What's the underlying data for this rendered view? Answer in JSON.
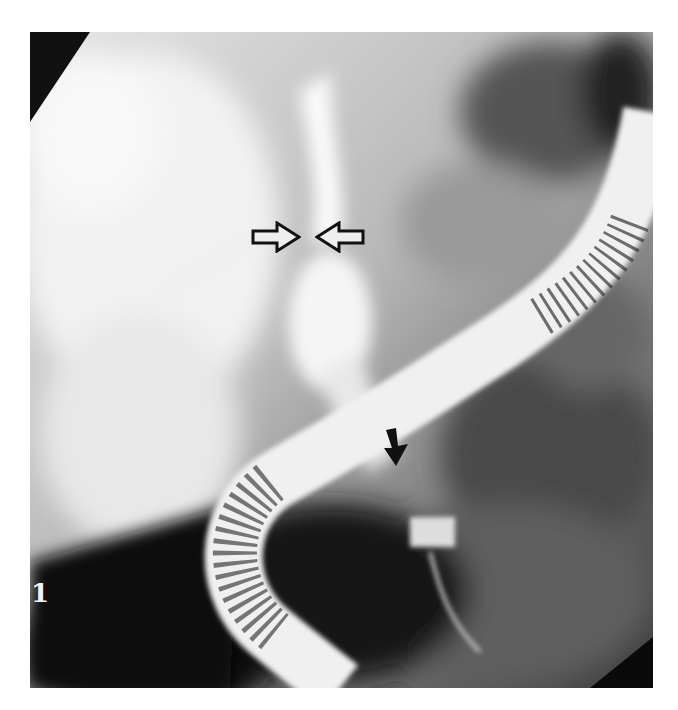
{
  "figure": {
    "panel_label": "1",
    "annotations": [
      {
        "type": "open-arrow-right",
        "label": "stricture-marker-left"
      },
      {
        "type": "open-arrow-left",
        "label": "stricture-marker-right"
      },
      {
        "type": "solid-arrow-down",
        "label": "distal-marker"
      }
    ],
    "colors": {
      "background": "#ffffff",
      "arrow_solid": "#111111",
      "arrow_outline": "#111111"
    }
  }
}
